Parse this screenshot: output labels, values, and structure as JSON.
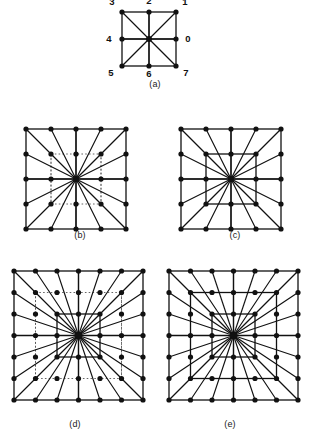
{
  "figure": {
    "background": "#ffffff",
    "ink_color": "#111111",
    "dotted_color": "#555555",
    "node_radius_small": 2.6,
    "node_radius_large": 3.0,
    "stroke_width_solid": 1.3,
    "stroke_width_ray": 1.15,
    "stroke_width_dotted": 0.9
  },
  "panels": [
    {
      "id": "a",
      "caption": "(a)",
      "type": "labelled-3x3",
      "grid": 3,
      "origin": {
        "x": 122,
        "y": 12
      },
      "step": 27,
      "caption_pos": {
        "x": 130,
        "y": 79,
        "w": 50
      },
      "center_index": {
        "col": 1,
        "row": 1
      },
      "dotted_rings": [],
      "solid_rings": [
        1
      ],
      "rays_to_ring": 1,
      "direction_labels": [
        {
          "text": "0",
          "col": 2,
          "row": 1,
          "dx": 12,
          "dy": 3
        },
        {
          "text": "1",
          "col": 2,
          "row": 0,
          "dx": 9,
          "dy": -7
        },
        {
          "text": "2",
          "col": 1,
          "row": 0,
          "dx": 0,
          "dy": -8
        },
        {
          "text": "3",
          "col": 0,
          "row": 0,
          "dx": -10,
          "dy": -7
        },
        {
          "text": "4",
          "col": 0,
          "row": 1,
          "dx": -13,
          "dy": 3
        },
        {
          "text": "5",
          "col": 0,
          "row": 2,
          "dx": -11,
          "dy": 10
        },
        {
          "text": "6",
          "col": 1,
          "row": 2,
          "dx": 0,
          "dy": 11
        },
        {
          "text": "7",
          "col": 2,
          "row": 2,
          "dx": 10,
          "dy": 10
        }
      ]
    },
    {
      "id": "b",
      "caption": "(b)",
      "type": "ring-mask",
      "grid": 5,
      "origin": {
        "x": 26,
        "y": 129
      },
      "step": 25,
      "caption_pos": {
        "x": 55,
        "y": 230,
        "w": 50
      },
      "center_index": {
        "col": 2,
        "row": 2
      },
      "dotted_rings": [
        1
      ],
      "solid_rings": [
        2
      ],
      "rays_to_ring": 2,
      "direction_labels": []
    },
    {
      "id": "c",
      "caption": "(c)",
      "type": "ring-mask",
      "grid": 5,
      "origin": {
        "x": 181,
        "y": 129
      },
      "step": 25,
      "caption_pos": {
        "x": 210,
        "y": 230,
        "w": 50
      },
      "center_index": {
        "col": 2,
        "row": 2
      },
      "dotted_rings": [],
      "solid_rings": [
        1,
        2
      ],
      "rays_to_ring": 2,
      "direction_labels": []
    },
    {
      "id": "d",
      "caption": "(d)",
      "type": "ring-mask",
      "grid": 7,
      "origin": {
        "x": 14,
        "y": 271
      },
      "step": 21.5,
      "caption_pos": {
        "x": 45,
        "y": 419,
        "w": 60
      },
      "center_index": {
        "col": 3,
        "row": 3
      },
      "dotted_rings": [
        2
      ],
      "solid_rings": [
        1,
        3
      ],
      "rays_to_ring": 3,
      "direction_labels": []
    },
    {
      "id": "e",
      "caption": "(e)",
      "type": "ring-mask",
      "grid": 7,
      "origin": {
        "x": 169,
        "y": 271
      },
      "step": 21.5,
      "caption_pos": {
        "x": 200,
        "y": 419,
        "w": 60
      },
      "center_index": {
        "col": 3,
        "row": 3
      },
      "dotted_rings": [],
      "solid_rings": [
        1,
        2,
        3
      ],
      "rays_to_ring": 3,
      "direction_labels": []
    }
  ],
  "chart_data": {
    "type": "diagram",
    "panels": [
      {
        "label": "(a)",
        "grid_size": "3x3",
        "node_count": 9,
        "center_connected_neighbours": 8,
        "direction_codes": [
          "0",
          "1",
          "2",
          "3",
          "4",
          "5",
          "6",
          "7"
        ],
        "direction_meaning": {
          "0": "east",
          "1": "north-east",
          "2": "north",
          "3": "north-west",
          "4": "west",
          "5": "south-west",
          "6": "south",
          "7": "south-east"
        },
        "dotted_square_rings": [],
        "solid_square_rings": [
          1
        ]
      },
      {
        "label": "(b)",
        "grid_size": "5x5",
        "node_count": 25,
        "center_connected_neighbours": 16,
        "dotted_square_rings": [
          1
        ],
        "solid_square_rings": [
          2
        ]
      },
      {
        "label": "(c)",
        "grid_size": "5x5",
        "node_count": 25,
        "center_connected_neighbours": 16,
        "dotted_square_rings": [],
        "solid_square_rings": [
          1,
          2
        ]
      },
      {
        "label": "(d)",
        "grid_size": "7x7",
        "node_count": 49,
        "center_connected_neighbours": 24,
        "dotted_square_rings": [
          2
        ],
        "solid_square_rings": [
          1,
          3
        ]
      },
      {
        "label": "(e)",
        "grid_size": "7x7",
        "node_count": 49,
        "center_connected_neighbours": 24,
        "dotted_square_rings": [],
        "solid_square_rings": [
          1,
          2,
          3
        ]
      }
    ]
  }
}
